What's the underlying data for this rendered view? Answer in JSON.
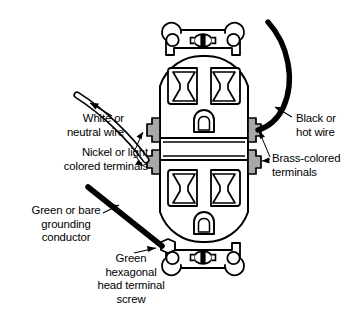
{
  "diagram": {
    "background_color": "#ffffff",
    "line_color": "#000000",
    "terminal_fill_color": "#a8a8a8",
    "wire_black_color": "#000000",
    "wire_white_fill": "#ffffff"
  },
  "labels": {
    "white_neutral_wire": "White or\nneutral wire",
    "nickel_terminals": "Nickel or light\ncolored terminals",
    "black_hot_wire": "Black or\nhot wire",
    "brass_terminals": "Brass-colored\nterminals",
    "green_grounding_conductor": "Green or bare\ngrounding\nconductor",
    "green_hex_screw": "Green\nhexagonal\nhead terminal\nscrew"
  },
  "parts": {
    "upper_outlet_face": "upper receptacle face",
    "lower_outlet_face": "lower receptacle face",
    "top_mounting_strap": "top mounting strap",
    "bottom_mounting_strap": "bottom mounting strap",
    "top_mounting_screw": "top mounting screw",
    "bottom_mounting_screw": "bottom mounting screw",
    "ground_hole_upper": "upper ground pin opening",
    "ground_hole_lower": "lower ground pin opening",
    "terminal_upper_left": "upper nickel terminal",
    "terminal_lower_left": "lower nickel terminal",
    "terminal_upper_right": "upper brass terminal",
    "terminal_lower_right": "lower brass terminal",
    "hex_ground_screw": "green hexagonal head terminal screw",
    "wire_black": "black hot wire",
    "wire_white": "white neutral wire",
    "wire_ground": "green or bare grounding conductor"
  }
}
